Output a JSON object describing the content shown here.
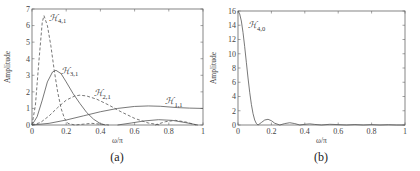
{
  "chart_data": [
    {
      "panel": "(a)",
      "type": "line",
      "xlabel": "ω/π",
      "ylabel": "Amplitude",
      "xlim": [
        0,
        1
      ],
      "ylim": [
        0,
        7
      ],
      "xticks": [
        "0",
        "0.2",
        "0.4",
        "0.6",
        "0.8",
        "1"
      ],
      "yticks": [
        "0",
        "1",
        "2",
        "3",
        "4",
        "5",
        "6",
        "7"
      ],
      "grid": false,
      "series": [
        {
          "name": "H4,1",
          "style": "dashed",
          "x": [
            0,
            0.02,
            0.04,
            0.06,
            0.07,
            0.09,
            0.11,
            0.13,
            0.15,
            0.17,
            0.19,
            0.21,
            0.25,
            0.3,
            0.35,
            0.4,
            0.45
          ],
          "y": [
            0,
            1.2,
            3.8,
            6.2,
            6.6,
            6.0,
            4.8,
            3.3,
            2.0,
            1.0,
            0.4,
            0.1,
            0.0,
            0.05,
            0.1,
            0.05,
            0.0
          ]
        },
        {
          "name": "H3,1",
          "style": "solid",
          "x": [
            0,
            0.03,
            0.06,
            0.09,
            0.12,
            0.14,
            0.17,
            0.2,
            0.24,
            0.28,
            0.32,
            0.36,
            0.4,
            0.43
          ],
          "y": [
            0,
            0.5,
            1.5,
            2.6,
            3.2,
            3.3,
            3.1,
            2.6,
            1.9,
            1.3,
            0.75,
            0.35,
            0.08,
            0.0
          ]
        },
        {
          "name": "H2,1",
          "style": "dashed",
          "x": [
            0,
            0.05,
            0.1,
            0.15,
            0.2,
            0.25,
            0.28,
            0.32,
            0.38,
            0.45,
            0.52,
            0.6,
            0.68,
            0.75
          ],
          "y": [
            0,
            0.15,
            0.55,
            1.05,
            1.5,
            1.75,
            1.8,
            1.75,
            1.55,
            1.2,
            0.8,
            0.4,
            0.12,
            0.0
          ]
        },
        {
          "name": "H1,1",
          "style": "solid",
          "x": [
            0,
            0.1,
            0.2,
            0.3,
            0.4,
            0.5,
            0.6,
            0.68,
            0.75,
            0.85,
            0.92,
            1.0
          ],
          "y": [
            0,
            0.1,
            0.3,
            0.55,
            0.8,
            1.0,
            1.12,
            1.15,
            1.13,
            1.05,
            1.02,
            1.0
          ]
        },
        {
          "name": "H2,1-lobe",
          "style": "dashed",
          "x": [
            0.72,
            0.78,
            0.84,
            0.9,
            0.96
          ],
          "y": [
            0.0,
            0.2,
            0.28,
            0.18,
            0.0
          ]
        },
        {
          "name": "H3,1-lobe",
          "style": "solid",
          "x": [
            0.5,
            0.58,
            0.66,
            0.74,
            0.82,
            0.9,
            0.97
          ],
          "y": [
            0.0,
            0.12,
            0.25,
            0.32,
            0.28,
            0.14,
            0.0
          ]
        }
      ],
      "annotations": [
        {
          "text": "H",
          "sub": "4,1",
          "x": 0.1,
          "y": 6.3
        },
        {
          "text": "H",
          "sub": "3,1",
          "x": 0.17,
          "y": 3.1
        },
        {
          "text": "H",
          "sub": "2,1",
          "x": 0.36,
          "y": 1.75
        },
        {
          "text": "H",
          "sub": "1,1",
          "x": 0.78,
          "y": 1.25
        }
      ],
      "caption": "(a)"
    },
    {
      "panel": "(b)",
      "type": "line",
      "xlabel": "ω/π",
      "ylabel": "Amplitude",
      "xlim": [
        0,
        1
      ],
      "ylim": [
        0,
        16
      ],
      "xticks": [
        "0",
        "0.2",
        "0.4",
        "0.6",
        "0.8",
        "1"
      ],
      "yticks": [
        "0",
        "2",
        "4",
        "6",
        "8",
        "10",
        "12",
        "14",
        "16"
      ],
      "grid": false,
      "series": [
        {
          "name": "H4,0",
          "style": "solid",
          "x": [
            0,
            0.01,
            0.02,
            0.03,
            0.04,
            0.05,
            0.06,
            0.07,
            0.08,
            0.09,
            0.1,
            0.11,
            0.12,
            0.14,
            0.16,
            0.18,
            0.2,
            0.22,
            0.25,
            0.28,
            0.31,
            0.34,
            0.37,
            0.4,
            0.43,
            0.46,
            0.5,
            0.55,
            0.6,
            0.65,
            0.7,
            0.75,
            0.8,
            0.85,
            0.9,
            0.95,
            1.0
          ],
          "y": [
            16,
            15.6,
            14.6,
            13.0,
            11.0,
            8.8,
            6.6,
            4.6,
            2.9,
            1.6,
            0.7,
            0.2,
            0.0,
            0.35,
            0.7,
            0.8,
            0.6,
            0.25,
            0.0,
            0.2,
            0.32,
            0.2,
            0.0,
            0.1,
            0.16,
            0.08,
            0.0,
            0.1,
            0.05,
            0.0,
            0.06,
            0.0,
            0.05,
            0.0,
            0.04,
            0.0,
            0.0
          ]
        }
      ],
      "annotations": [
        {
          "text": "H",
          "sub": "4,0",
          "x": 0.06,
          "y": 13.6
        }
      ],
      "caption": "(b)"
    }
  ],
  "labels": {
    "a": {
      "xlabel": "ω/π",
      "ylabel": "Amplitude",
      "caption": "(a)"
    },
    "b": {
      "xlabel": "ω/π",
      "ylabel": "Amplitude",
      "caption": "(b)"
    }
  }
}
